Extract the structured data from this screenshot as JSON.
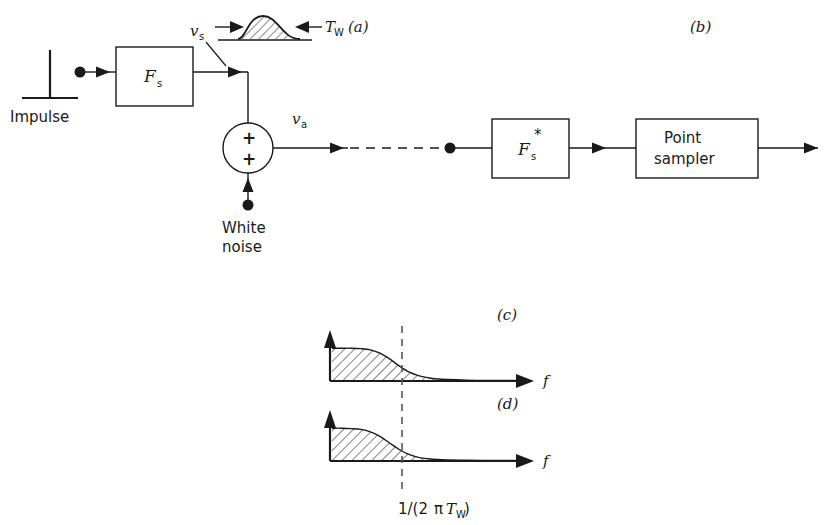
{
  "figure": {
    "panels": {
      "a": "(a)",
      "b": "(b)",
      "c": "(c)",
      "d": "(d)"
    }
  },
  "blocks": {
    "filter_fs": {
      "label": "F",
      "subscript": "s",
      "superscript": ""
    },
    "filter_fs_star": {
      "label": "F",
      "subscript": "s",
      "superscript": "*"
    },
    "point_sampler": {
      "line1": "Point",
      "line2": "sampler"
    }
  },
  "sources": {
    "impulse": {
      "label": "Impulse"
    },
    "white_noise": {
      "line1": "White",
      "line2": "noise"
    }
  },
  "signals": {
    "vs": {
      "symbol": "v",
      "subscript": "s"
    },
    "va": {
      "symbol": "v",
      "subscript": "a"
    }
  },
  "pulse_inset": {
    "width_label": {
      "symbol": "T",
      "subscript": "W"
    }
  },
  "summer": {
    "input_top_sign": "+",
    "input_bottom_sign": "+"
  },
  "chart_data": [
    {
      "type": "area",
      "name": "(c)",
      "title": "(c)",
      "xlabel": "f",
      "ylabel": "",
      "grid": false,
      "legend": null,
      "xlim": [
        0,
        1
      ],
      "ylim": [
        0,
        1
      ],
      "annotations": [
        {
          "text": "1/(2πT_W)",
          "x": 0.36,
          "kind": "vertical-dashed-line"
        }
      ],
      "x": [
        0.0,
        0.05,
        0.1,
        0.15,
        0.2,
        0.25,
        0.3,
        0.35,
        0.4,
        0.45,
        0.5,
        0.55,
        0.6,
        0.7,
        0.8,
        0.9,
        1.0
      ],
      "y": [
        0.8,
        0.8,
        0.8,
        0.79,
        0.76,
        0.68,
        0.54,
        0.37,
        0.22,
        0.13,
        0.08,
        0.05,
        0.035,
        0.02,
        0.015,
        0.012,
        0.01
      ],
      "fill": "hatched"
    },
    {
      "type": "area",
      "name": "(d)",
      "title": "(d)",
      "xlabel": "f",
      "ylabel": "",
      "grid": false,
      "legend": null,
      "xlim": [
        0,
        1
      ],
      "ylim": [
        0,
        1
      ],
      "annotations": [
        {
          "text": "1/(2πT_W)",
          "x": 0.36,
          "kind": "vertical-dashed-line"
        }
      ],
      "x": [
        0.0,
        0.05,
        0.1,
        0.15,
        0.2,
        0.25,
        0.3,
        0.35,
        0.4,
        0.45,
        0.5,
        0.55,
        0.6,
        0.7,
        0.8,
        0.9,
        1.0
      ],
      "y": [
        0.8,
        0.8,
        0.79,
        0.77,
        0.71,
        0.6,
        0.44,
        0.28,
        0.16,
        0.09,
        0.055,
        0.035,
        0.025,
        0.018,
        0.014,
        0.012,
        0.01
      ],
      "fill": "hatched"
    }
  ],
  "axis_labels": {
    "frequency": "f",
    "cutoff": {
      "prefix": "1/(2",
      "pi": "π",
      "sym": "T",
      "sub": "W",
      "suffix": ")"
    }
  }
}
